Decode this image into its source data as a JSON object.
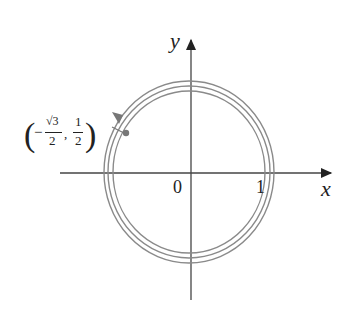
{
  "diagram": {
    "x_axis_label": "x",
    "y_axis_label": "y",
    "origin_label": "0",
    "tick_label_1": "1",
    "point_label": {
      "open": "(",
      "minus": "−",
      "sqrt_num": "√3",
      "den1": "2",
      "comma": ",",
      "num2": "1",
      "den2": "2",
      "close": ")"
    },
    "curve": "spiral of three nearly-concentric circles with arrow indicating counter-clockwise direction",
    "colors": {
      "axis": "#444444",
      "curve": "#8a8a8a",
      "point": "#777777"
    }
  }
}
